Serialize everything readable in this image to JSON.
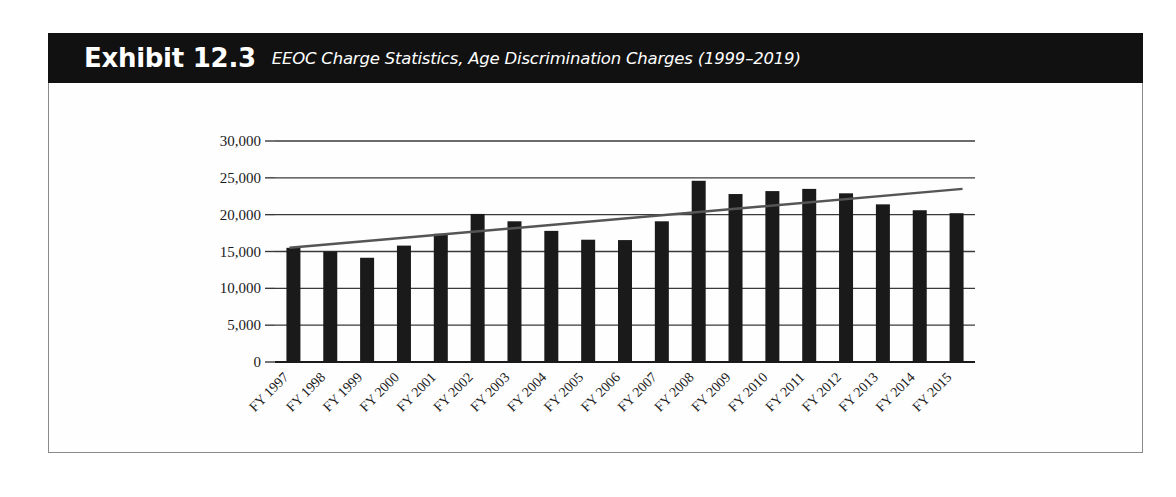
{
  "exhibit": {
    "label": "Exhibit",
    "number": "12.3",
    "subtitle": "EEOC Charge Statistics, Age Discrimination Charges (1999–2019)"
  },
  "colors": {
    "title_bar_bg": "#111111",
    "title_text": "#ffffff",
    "bar_fill": "#1a1a1a",
    "trendline": "#555555",
    "gridline": "#3a3a3a",
    "frame_border": "#8a8a8a",
    "page_bg": "#ffffff"
  },
  "chart_data": {
    "type": "bar",
    "title": "EEOC Charge Statistics, Age Discrimination Charges (1999–2019)",
    "xlabel": "",
    "ylabel": "",
    "ylim": [
      0,
      30000
    ],
    "yticks": [
      0,
      5000,
      10000,
      15000,
      20000,
      25000,
      30000
    ],
    "ytick_labels": [
      "0",
      "5,000",
      "10,000",
      "15,000",
      "20,000",
      "25,000",
      "30,000"
    ],
    "grid": true,
    "legend": "none",
    "categories": [
      "FY 1997",
      "FY 1998",
      "FY 1999",
      "FY 2000",
      "FY 2001",
      "FY 2002",
      "FY 2003",
      "FY 2004",
      "FY 2005",
      "FY 2006",
      "FY 2007",
      "FY 2008",
      "FY 2009",
      "FY 2010",
      "FY 2011",
      "FY 2012",
      "FY 2013",
      "FY 2014",
      "FY 2015"
    ],
    "values": [
      15500,
      15000,
      14150,
      15800,
      17400,
      20100,
      19100,
      17800,
      16600,
      16550,
      19100,
      24600,
      22800,
      23200,
      23500,
      22900,
      21400,
      20600,
      20200
    ],
    "series": [
      {
        "name": "Age Discrimination Charges",
        "values": [
          15500,
          15000,
          14150,
          15800,
          17400,
          20100,
          19100,
          17800,
          16600,
          16550,
          19100,
          24600,
          22800,
          23200,
          23500,
          22900,
          21400,
          20600,
          20200
        ]
      }
    ],
    "trendline": {
      "type": "linear",
      "start_value": 15500,
      "end_value": 23500
    }
  }
}
